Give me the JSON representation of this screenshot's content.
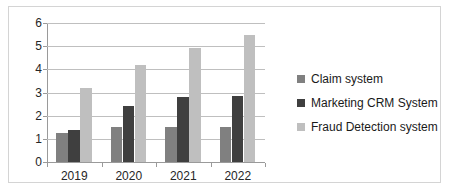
{
  "chart_data": {
    "type": "bar",
    "title": "",
    "subtitle": "",
    "xlabel": "",
    "ylabel": "",
    "categories": [
      "2019",
      "2020",
      "2021",
      "2022"
    ],
    "series": [
      {
        "name": "Claim system",
        "color": "#808080",
        "values": [
          1.25,
          1.5,
          1.5,
          1.5
        ]
      },
      {
        "name": "Marketing CRM System",
        "color": "#3f3f3f",
        "values": [
          1.4,
          2.4,
          2.8,
          2.85
        ]
      },
      {
        "name": "Fraud Detection system",
        "color": "#bfbfbf",
        "values": [
          3.2,
          4.2,
          4.9,
          5.5
        ]
      }
    ],
    "ylim": [
      0,
      6
    ],
    "ytick_labels": [
      "0",
      "1",
      "2",
      "3",
      "4",
      "5",
      "6"
    ],
    "ytick_values": [
      0,
      1,
      2,
      3,
      4,
      5,
      6
    ],
    "grid": true,
    "grid_axis": "y",
    "legend": {
      "position": "right",
      "entries": [
        {
          "label": "Claim system",
          "color": "#808080"
        },
        {
          "label": "Marketing CRM System",
          "color": "#3f3f3f"
        },
        {
          "label": "Fraud Detection system",
          "color": "#bfbfbf"
        }
      ]
    },
    "frame": {
      "border_color": "#d4d4d4",
      "background": "#ffffff"
    },
    "axis_color": "#9a9a9a",
    "gridline_color": "#bfbfbf"
  }
}
